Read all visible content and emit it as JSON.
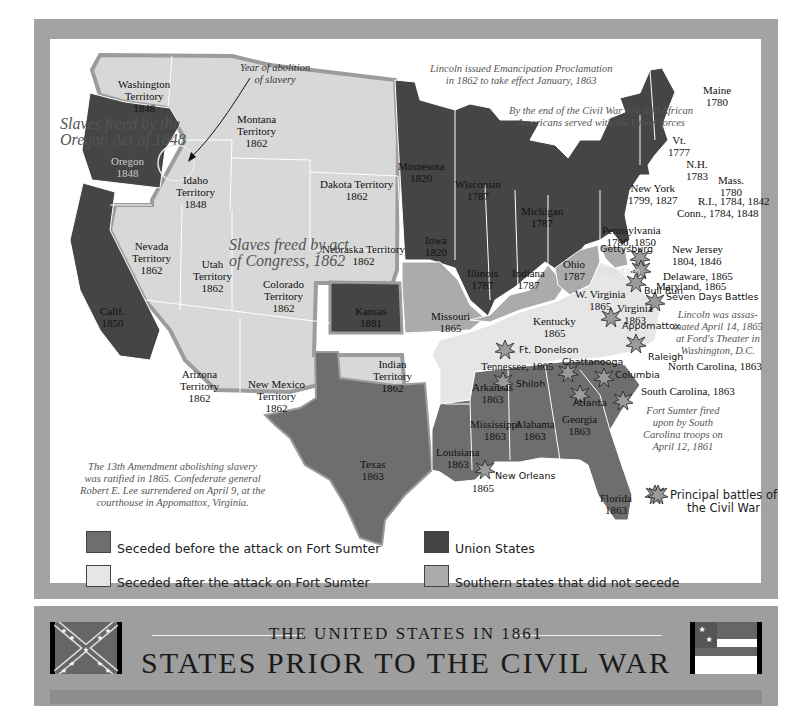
{
  "map": {
    "title": "STATES PRIOR TO THE CIVIL WAR",
    "subtitle": "THE UNITED STATES IN 1861",
    "colors": {
      "seceded_before": "#6e6e6e",
      "seceded_after": "#e6e6e6",
      "union": "#454545",
      "did_not_secede": "#ababab",
      "territory": "#d8d8d8",
      "frame": "#a3a3a3"
    },
    "annotations": {
      "year_abolition": "Year of abolition\nof slavery",
      "oregon_act_line1": "Slaves freed by the",
      "oregon_act_line2": "Oregon Act of 1848",
      "congress_line1": "Slaves freed by act",
      "congress_line2": "of Congress, 1862",
      "emancipation_line1": "Lincoln issued Emancipation Proclamation",
      "emancipation_line2": "in 1862 to take effect January, 1863",
      "african_americans_line1": "By the end of the Civil War 186,000 African",
      "african_americans_line2": "Americans served with the Union forces",
      "lincoln_line1": "Lincoln was assas-",
      "lincoln_line2": "inated April 14, 1865",
      "lincoln_line3": "at Ford's Theater in",
      "lincoln_line4": "Washington, D.C.",
      "sumter_line1": "Fort Sumter fired",
      "sumter_line2": "upon by South",
      "sumter_line3": "Carolina troops on",
      "sumter_line4": "April 12, 1861",
      "amendment_line1": "The 13th Amendment abolishing slavery",
      "amendment_line2": "was ratified in 1865. Confederate general",
      "amendment_line3": "Robert E. Lee surrendered on April 9, at the",
      "amendment_line4": "courthouse in Appomattox, Virginia."
    },
    "states": [
      {
        "name": "Washington",
        "sub": "Territory",
        "year": "1848"
      },
      {
        "name": "Oregon",
        "year": "1848"
      },
      {
        "name": "Idaho",
        "sub": "Territory",
        "year": "1848"
      },
      {
        "name": "Montana",
        "sub": "Territory",
        "year": "1862"
      },
      {
        "name": "Dakota Territory",
        "year": "1862"
      },
      {
        "name": "Nebraska Territory",
        "year": "1862"
      },
      {
        "name": "Nevada",
        "sub": "Territory",
        "year": "1862"
      },
      {
        "name": "Utah",
        "sub": "Territory",
        "year": "1862"
      },
      {
        "name": "Colorado",
        "sub": "Territory",
        "year": "1862"
      },
      {
        "name": "Calif.",
        "year": "1850"
      },
      {
        "name": "Kansas",
        "year": "1881"
      },
      {
        "name": "Arizona",
        "sub": "Territory",
        "year": "1862"
      },
      {
        "name": "New Mexico",
        "sub": "Territory",
        "year": "1862"
      },
      {
        "name": "Indian",
        "sub": "Territory",
        "year": "1862"
      },
      {
        "name": "Texas",
        "year": "1863"
      },
      {
        "name": "Minnesota",
        "year": "1820"
      },
      {
        "name": "Wisconsin",
        "year": "1787"
      },
      {
        "name": "Michigan",
        "year": "1787"
      },
      {
        "name": "Iowa",
        "year": "1820"
      },
      {
        "name": "Illinois",
        "year": "1787"
      },
      {
        "name": "Indiana",
        "year": "1787"
      },
      {
        "name": "Ohio",
        "year": "1787"
      },
      {
        "name": "Missouri",
        "year": "1865"
      },
      {
        "name": "Kentucky",
        "year": "1865"
      },
      {
        "name": "W. Virginia",
        "year": "1865"
      },
      {
        "name": "Virginia",
        "year": "1863"
      },
      {
        "name": "Arkansas",
        "year": "1863"
      },
      {
        "name": "Tennessee, 1865"
      },
      {
        "name": "Mississippi",
        "year": "1863"
      },
      {
        "name": "Alabama",
        "year": "1863"
      },
      {
        "name": "Georgia",
        "year": "1863"
      },
      {
        "name": "Louisiana",
        "year": "1863"
      },
      {
        "name": "1865"
      },
      {
        "name": "Florida",
        "year": "1863"
      },
      {
        "name": "North Carolina, 1863"
      },
      {
        "name": "South Carolina, 1863"
      },
      {
        "name": "New York",
        "year": "1799, 1827"
      },
      {
        "name": "Pennsylvania",
        "year": "1780, 1850"
      },
      {
        "name": "New Jersey",
        "year": "1804, 1846"
      },
      {
        "name": "Delaware, 1865"
      },
      {
        "name": "Maryland, 1865"
      },
      {
        "name": "Maine",
        "year": "1780"
      },
      {
        "name": "Vt.",
        "year": "1777"
      },
      {
        "name": "N.H.",
        "year": "1783"
      },
      {
        "name": "Mass.",
        "year": "1780"
      },
      {
        "name": "R.I., 1784, 1842"
      },
      {
        "name": "Conn., 1784, 1848"
      }
    ],
    "battles": [
      "Gettysburg",
      "Antietam",
      "Bull Run",
      "Seven Days Battles",
      "Appomattox",
      "Raleigh",
      "Ft. Donelson",
      "Shiloh",
      "Chattanooga",
      "Columbia",
      "Atlanta",
      "New Orleans"
    ],
    "legend": [
      {
        "label": "Seceded before the attack on Fort Sumter",
        "color": "#6e6e6e"
      },
      {
        "label": "Seceded after the attack on Fort Sumter",
        "color": "#e6e6e6"
      },
      {
        "label": "Union States",
        "color": "#454545"
      },
      {
        "label": "Southern states that did not secede",
        "color": "#ababab"
      },
      {
        "label": "Principal battles of\nthe Civil War",
        "icon": "battle-burst-icon"
      }
    ],
    "legend_battle_line1": "Principal battles of",
    "legend_battle_line2": "the Civil War"
  }
}
